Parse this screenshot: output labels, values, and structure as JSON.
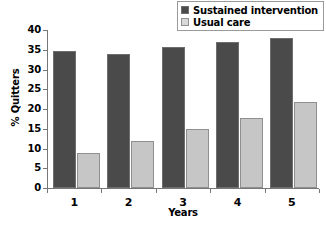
{
  "chart_data": {
    "type": "bar",
    "title": "",
    "xlabel": "Years",
    "ylabel": "% Quitters",
    "categories": [
      "1",
      "2",
      "3",
      "4",
      "5"
    ],
    "series": [
      {
        "name": "Sustained intervention",
        "color": "#4a4a4a",
        "values": [
          34.8,
          33.9,
          35.8,
          36.9,
          38.0
        ]
      },
      {
        "name": "Usual care",
        "color": "#c6c6c6",
        "values": [
          8.9,
          11.9,
          14.9,
          17.8,
          21.8
        ]
      }
    ],
    "ylim": [
      0,
      40
    ],
    "yticks": [
      0,
      5,
      10,
      15,
      20,
      25,
      30,
      35,
      40
    ],
    "ytick_labels": [
      "0",
      "5",
      "10",
      "15",
      "20",
      "25",
      "30",
      "35",
      "40"
    ],
    "grid": false,
    "legend_position": "top-right"
  }
}
